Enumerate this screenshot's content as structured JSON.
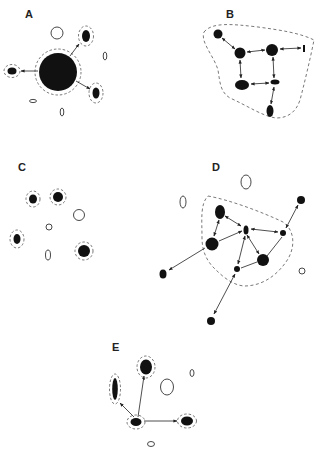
{
  "figure": {
    "panels": [
      {
        "id": "A",
        "label": "A"
      },
      {
        "id": "B",
        "label": "B"
      },
      {
        "id": "C",
        "label": "C"
      },
      {
        "id": "D",
        "label": "D"
      },
      {
        "id": "E",
        "label": "E"
      }
    ]
  },
  "colors": {
    "node_fill": "#111111",
    "open_stroke": "#333333",
    "dashed_stroke": "#555555",
    "edge": "#222222",
    "background": "#ffffff"
  }
}
